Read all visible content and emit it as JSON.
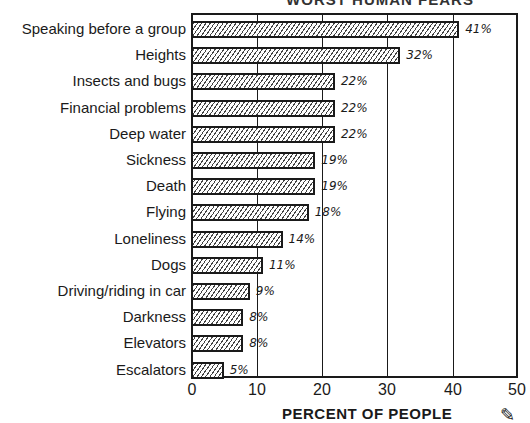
{
  "chart_data": {
    "type": "bar",
    "orientation": "horizontal",
    "title": "WORST HUMAN FEARS",
    "xlabel": "PERCENT OF PEOPLE",
    "ylabel": "",
    "xlim": [
      0,
      50
    ],
    "xticks": [
      "0",
      "10",
      "20",
      "30",
      "40",
      "50"
    ],
    "grid": true,
    "categories": [
      "Speaking before a group",
      "Heights",
      "Insects and bugs",
      "Financial problems",
      "Deep water",
      "Sickness",
      "Death",
      "Flying",
      "Loneliness",
      "Dogs",
      "Driving/riding in car",
      "Darkness",
      "Elevators",
      "Escalators"
    ],
    "values": [
      41,
      32,
      22,
      22,
      22,
      19,
      19,
      18,
      14,
      11,
      9,
      8,
      8,
      5
    ],
    "value_labels": [
      "41%",
      "32%",
      "22%",
      "22%",
      "22%",
      "19%",
      "19%",
      "18%",
      "14%",
      "11%",
      "9%",
      "8%",
      "8%",
      "5%"
    ]
  },
  "corner_icon": "pencil-icon"
}
